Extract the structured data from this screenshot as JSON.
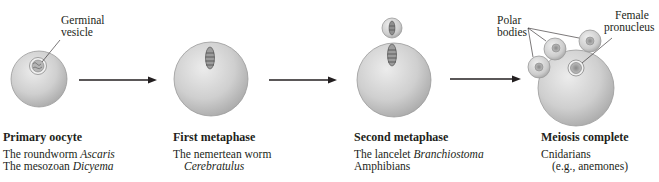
{
  "figure": {
    "type": "meiosis-stage-of-sperm-entry diagram",
    "colors": {
      "cell_light": "#e4e4e4",
      "cell_dark": "#a8a8a8",
      "outline": "#8a8a8a",
      "text": "#231f20",
      "arrow": "#231f20"
    }
  },
  "labels": {
    "germinal_vesicle_line1": "Germinal",
    "germinal_vesicle_line2": "vesicle",
    "polar_bodies_line1": "Polar",
    "polar_bodies_line2": "bodies",
    "female_pronucleus_line1": "Female",
    "female_pronucleus_line2": "pronucleus"
  },
  "stages": [
    {
      "title": "Primary oocyte",
      "examples": [
        {
          "prefix": "The roundworm ",
          "italic": "Ascaris"
        },
        {
          "prefix": "The mesozoan ",
          "italic": "Dicyema"
        }
      ]
    },
    {
      "title": "First metaphase",
      "examples": [
        {
          "prefix": "The nemertean worm",
          "italic": ""
        },
        {
          "prefix": "",
          "italic": "Cerebratulus"
        }
      ]
    },
    {
      "title": "Second metaphase",
      "examples": [
        {
          "prefix": "The lancelet ",
          "italic": "Branchiostoma"
        },
        {
          "prefix": "Amphibians",
          "italic": ""
        }
      ]
    },
    {
      "title": "Meiosis complete",
      "examples": [
        {
          "prefix": "Cnidarians",
          "italic": ""
        },
        {
          "prefix": "(e.g., anemones)",
          "italic": ""
        }
      ]
    }
  ]
}
